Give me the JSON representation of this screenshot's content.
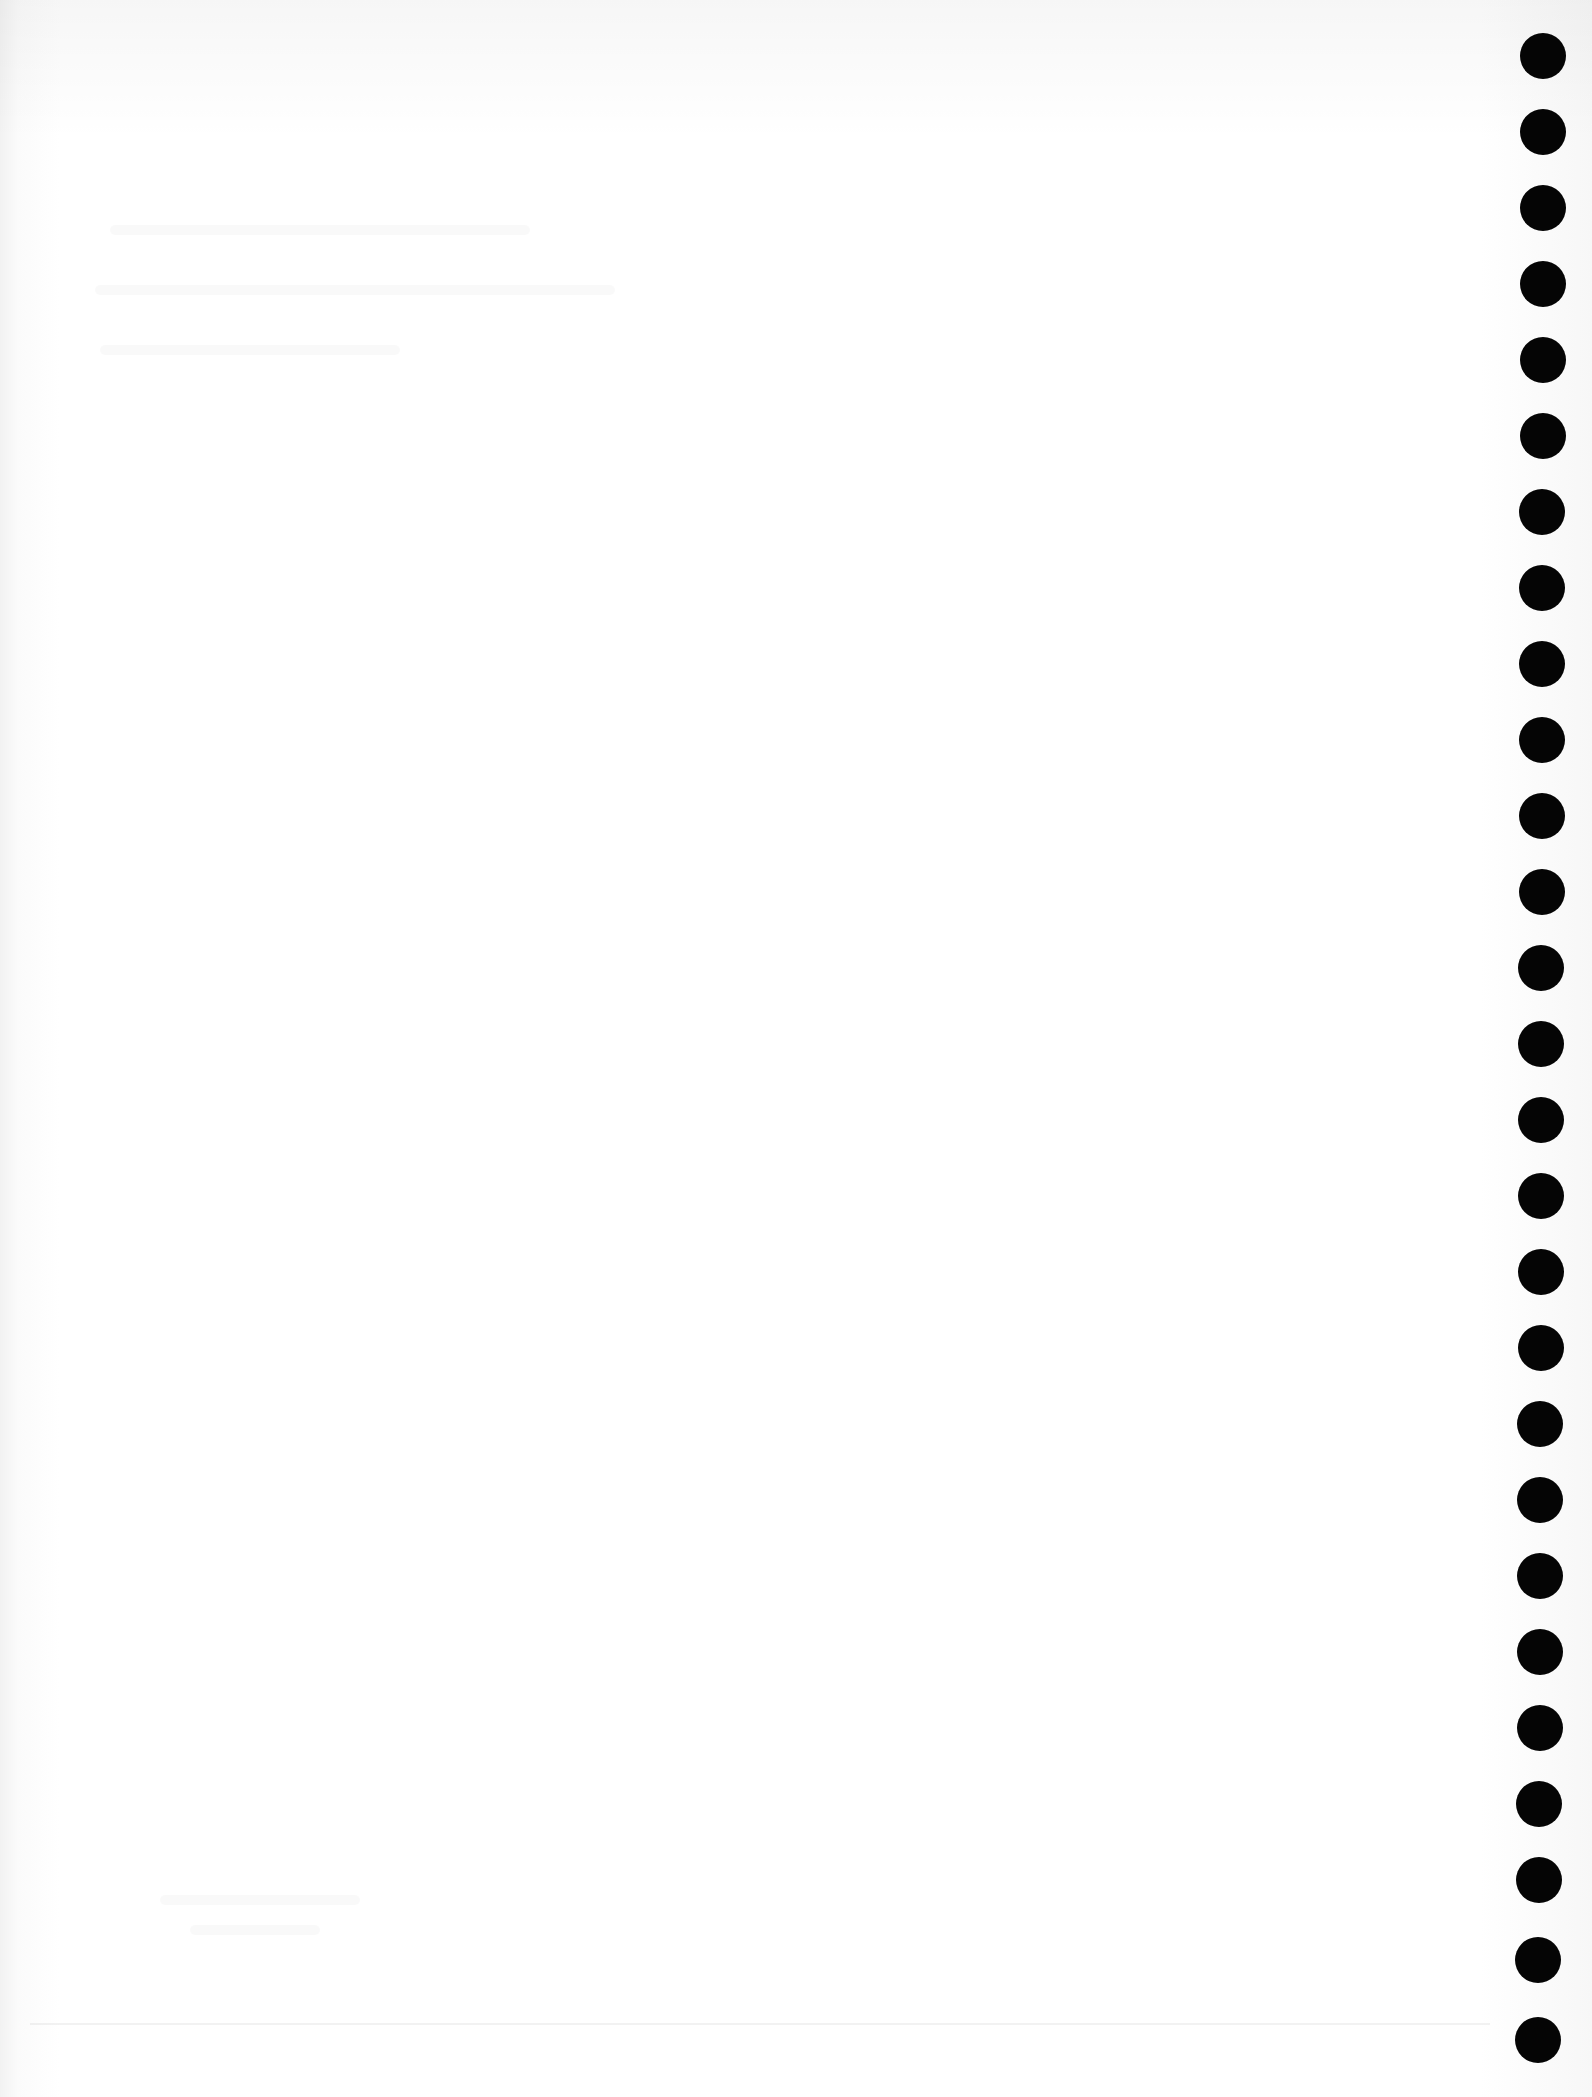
{
  "document": {
    "type": "blank punched sheet",
    "text": "",
    "hole_color": "#050505",
    "paper_color": "#fdfdfd",
    "hole_count": 27
  },
  "holes": [
    {
      "x": 1520,
      "y": 33
    },
    {
      "x": 1520,
      "y": 109
    },
    {
      "x": 1520,
      "y": 185
    },
    {
      "x": 1520,
      "y": 261
    },
    {
      "x": 1520,
      "y": 337
    },
    {
      "x": 1520,
      "y": 413
    },
    {
      "x": 1519,
      "y": 489
    },
    {
      "x": 1519,
      "y": 565
    },
    {
      "x": 1519,
      "y": 641
    },
    {
      "x": 1519,
      "y": 717
    },
    {
      "x": 1519,
      "y": 793
    },
    {
      "x": 1519,
      "y": 869
    },
    {
      "x": 1518,
      "y": 945
    },
    {
      "x": 1518,
      "y": 1021
    },
    {
      "x": 1518,
      "y": 1097
    },
    {
      "x": 1518,
      "y": 1173
    },
    {
      "x": 1518,
      "y": 1249
    },
    {
      "x": 1518,
      "y": 1325
    },
    {
      "x": 1517,
      "y": 1401
    },
    {
      "x": 1517,
      "y": 1477
    },
    {
      "x": 1517,
      "y": 1553
    },
    {
      "x": 1517,
      "y": 1629
    },
    {
      "x": 1517,
      "y": 1705
    },
    {
      "x": 1516,
      "y": 1781
    },
    {
      "x": 1516,
      "y": 1857
    },
    {
      "x": 1515,
      "y": 1937
    },
    {
      "x": 1515,
      "y": 2017
    }
  ]
}
